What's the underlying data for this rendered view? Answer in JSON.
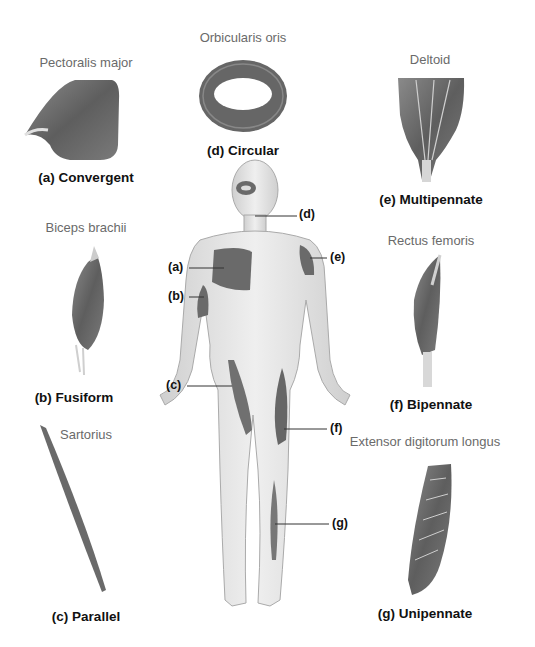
{
  "figure": {
    "muscles": [
      {
        "id": "a",
        "name": "Pectoralis major",
        "type": "(a) Convergent",
        "callout": "(a)"
      },
      {
        "id": "b",
        "name": "Biceps brachii",
        "type": "(b) Fusiform",
        "callout": "(b)"
      },
      {
        "id": "c",
        "name": "Sartorius",
        "type": "(c) Parallel",
        "callout": "(c)"
      },
      {
        "id": "d",
        "name": "Orbicularis oris",
        "type": "(d) Circular",
        "callout": "(d)"
      },
      {
        "id": "e",
        "name": "Deltoid",
        "type": "(e) Multipennate",
        "callout": "(e)"
      },
      {
        "id": "f",
        "name": "Rectus femoris",
        "type": "(f) Bipennate",
        "callout": "(f)"
      },
      {
        "id": "g",
        "name": "Extensor digitorum longus",
        "type": "(g) Unipennate",
        "callout": "(g)"
      }
    ],
    "colors": {
      "muscle": "#6e6e6e",
      "muscle_dark": "#4a4a4a",
      "skin": "#e6e6e6",
      "skin_edge": "#a8a8a8",
      "tendon": "#d8d8d8",
      "line": "#333333"
    }
  }
}
